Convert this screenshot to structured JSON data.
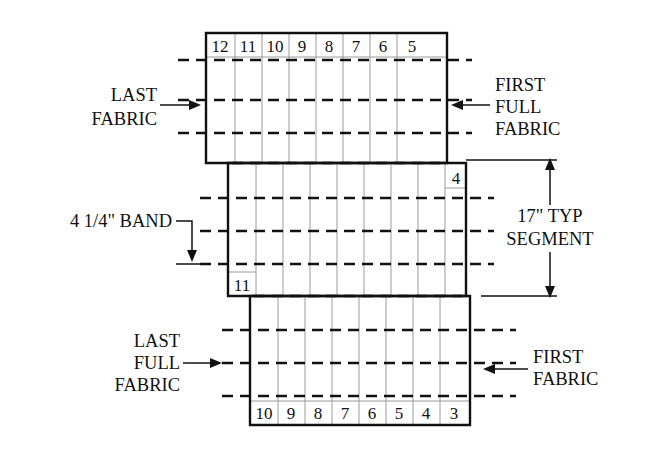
{
  "diagram": {
    "background_color": "#ffffff",
    "line_color": "#111111",
    "cell_divider_color": "#9a9a9a",
    "panels": [
      {
        "name": "top-panel",
        "cell_label_position": "top",
        "cells": [
          "12",
          "11",
          "10",
          "9",
          "8",
          "7",
          "6",
          "5"
        ]
      },
      {
        "name": "middle-panel",
        "cell_label_position": "top-right-and-bottom-left",
        "cells": [
          "4",
          "11"
        ]
      },
      {
        "name": "bottom-panel",
        "cell_label_position": "bottom",
        "cells": [
          "10",
          "9",
          "8",
          "7",
          "6",
          "5",
          "4",
          "3"
        ]
      }
    ],
    "annotations": {
      "last_fabric": {
        "lines": [
          "LAST",
          "FABRIC"
        ],
        "arrow": "right"
      },
      "first_full_fabric": {
        "lines": [
          "FIRST",
          "FULL",
          "FABRIC"
        ],
        "arrow": "left"
      },
      "band": {
        "lines": [
          "4 1/4\" BAND"
        ],
        "arrow": "down"
      },
      "segment": {
        "lines": [
          "17\" TYP",
          "SEGMENT"
        ],
        "arrow": "both-vertical"
      },
      "last_full_fabric": {
        "lines": [
          "LAST",
          "FULL",
          "FABRIC"
        ],
        "arrow": "right"
      },
      "first_fabric": {
        "lines": [
          "FIRST",
          "FABRIC"
        ],
        "arrow": "left"
      }
    },
    "cell_labels": {
      "top": [
        "12",
        "11",
        "10",
        "9",
        "8",
        "7",
        "6",
        "5"
      ],
      "middle_right": "4",
      "middle_left": "11",
      "bottom": [
        "10",
        "9",
        "8",
        "7",
        "6",
        "5",
        "4",
        "3"
      ]
    }
  }
}
